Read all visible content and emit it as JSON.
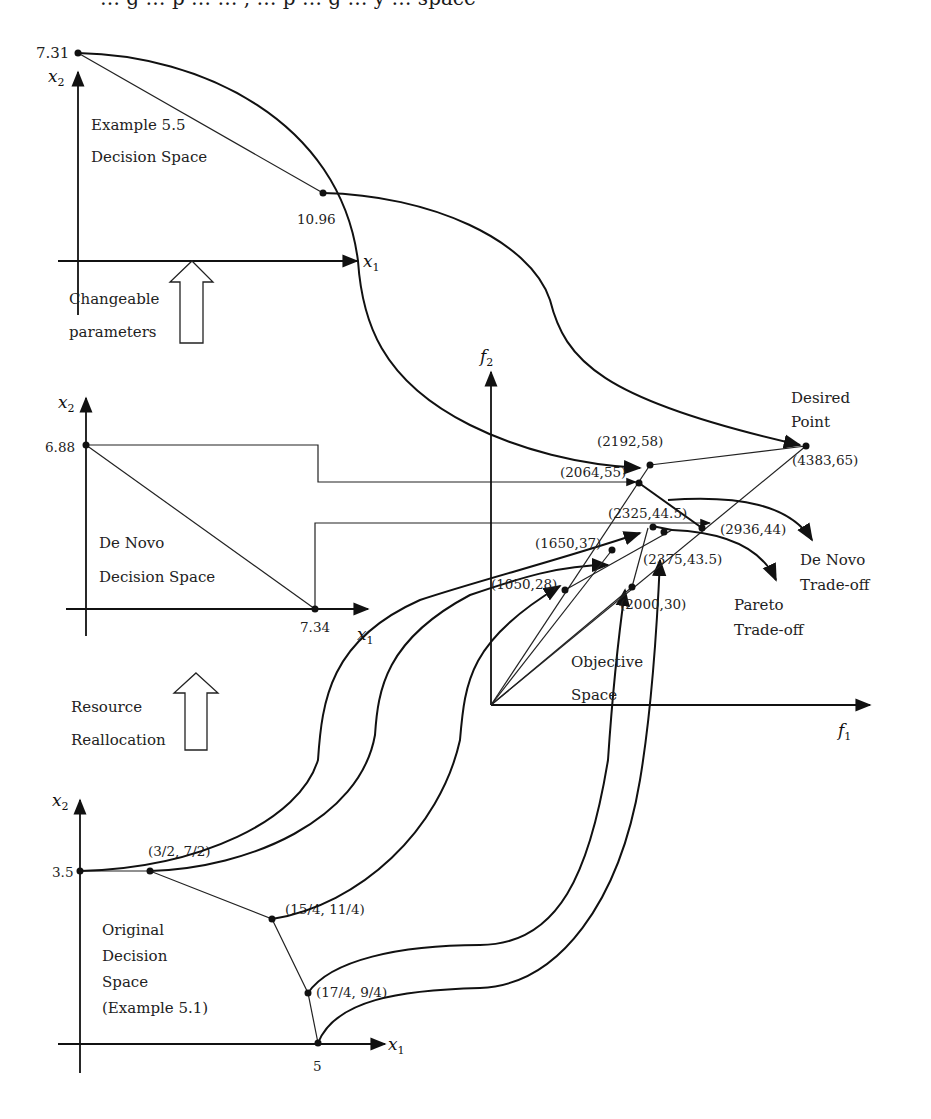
{
  "header": {
    "clipped_text": "… g … p … … , … p … g … y … space"
  },
  "panels": {
    "example55": {
      "title_line1": "Example 5.5",
      "title_line2": "Decision Space",
      "x_axis": "x",
      "x_sub": "1",
      "y_axis": "x",
      "y_sub": "2",
      "y_intercept": "7.31",
      "x_point_label": "10.96"
    },
    "changeable": {
      "line1": "Changeable",
      "line2": "parameters"
    },
    "denovo": {
      "title_line1": "De Novo",
      "title_line2": "Decision Space",
      "x_axis": "x",
      "x_sub": "1",
      "y_axis": "x",
      "y_sub": "2",
      "y_intercept": "6.88",
      "x_intercept": "7.34"
    },
    "resource": {
      "line1": "Resource",
      "line2": "Reallocation"
    },
    "original": {
      "title_line1": "Original",
      "title_line2": "Decision",
      "title_line3": "Space",
      "title_line4": "(Example 5.1)",
      "x_axis": "x",
      "x_sub": "1",
      "y_axis": "x",
      "y_sub": "2",
      "y_intercept": "3.5",
      "x_intercept": "5",
      "points": [
        "(3/2, 7/2)",
        "(15/4, 11/4)",
        "(17/4, 9/4)"
      ]
    },
    "objective": {
      "title_line1": "Objective",
      "title_line2": "Space",
      "x_axis": "f",
      "x_sub": "1",
      "y_axis": "f",
      "y_sub": "2",
      "points": {
        "p2192_58": "(2192,58)",
        "p2064_55": "(2064,55)",
        "p4383_65": "(4383,65)",
        "p2325_44_5": "(2325,44.5)",
        "p2936_44": "(2936,44)",
        "p1650_37": "(1650,37)",
        "p2375_43_5": "(2375,43.5)",
        "p1050_28": "(1050,28)",
        "p2000_30": "(2000,30)"
      },
      "desired_line1": "Desired",
      "desired_line2": "Point",
      "denovo_tradeoff_line1": "De Novo",
      "denovo_tradeoff_line2": "Trade-off",
      "pareto_tradeoff_line1": "Pareto",
      "pareto_tradeoff_line2": "Trade-off"
    }
  }
}
